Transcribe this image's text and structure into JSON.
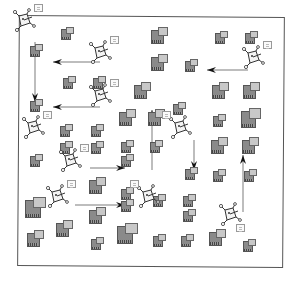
{
  "diagram": {
    "title": "",
    "frame": {
      "x": 18,
      "y": 16,
      "w": 266,
      "h": 251,
      "color": "#555555"
    },
    "colors": {
      "node_back": "#8a8a8a",
      "node_front": "#c8c8c8",
      "line": "#444444",
      "arrow": "#111111"
    },
    "nodes": [
      {
        "x": 68,
        "y": 33,
        "s": 1
      },
      {
        "x": 160,
        "y": 35,
        "s": 1.3
      },
      {
        "x": 222,
        "y": 37,
        "s": 1
      },
      {
        "x": 252,
        "y": 37,
        "s": 1
      },
      {
        "x": 37,
        "y": 50,
        "s": 1
      },
      {
        "x": 160,
        "y": 62,
        "s": 1.3
      },
      {
        "x": 192,
        "y": 65,
        "s": 1
      },
      {
        "x": 70,
        "y": 82,
        "s": 1
      },
      {
        "x": 100,
        "y": 82,
        "s": 1
      },
      {
        "x": 143,
        "y": 90,
        "s": 1.3
      },
      {
        "x": 221,
        "y": 90,
        "s": 1.3
      },
      {
        "x": 252,
        "y": 90,
        "s": 1.3
      },
      {
        "x": 180,
        "y": 108,
        "s": 1
      },
      {
        "x": 37,
        "y": 105,
        "s": 1
      },
      {
        "x": 128,
        "y": 117,
        "s": 1.3
      },
      {
        "x": 157,
        "y": 117,
        "s": 1.3
      },
      {
        "x": 220,
        "y": 120,
        "s": 1
      },
      {
        "x": 251,
        "y": 118,
        "s": 1.5
      },
      {
        "x": 67,
        "y": 130,
        "s": 1
      },
      {
        "x": 98,
        "y": 130,
        "s": 1
      },
      {
        "x": 67,
        "y": 147,
        "s": 1
      },
      {
        "x": 98,
        "y": 147,
        "s": 1
      },
      {
        "x": 128,
        "y": 146,
        "s": 1
      },
      {
        "x": 157,
        "y": 146,
        "s": 1
      },
      {
        "x": 37,
        "y": 160,
        "s": 1
      },
      {
        "x": 128,
        "y": 160,
        "s": 1
      },
      {
        "x": 220,
        "y": 145,
        "s": 1.3
      },
      {
        "x": 251,
        "y": 145,
        "s": 1.3
      },
      {
        "x": 98,
        "y": 185,
        "s": 1.3
      },
      {
        "x": 128,
        "y": 193,
        "s": 1
      },
      {
        "x": 192,
        "y": 173,
        "s": 1
      },
      {
        "x": 220,
        "y": 175,
        "s": 1
      },
      {
        "x": 251,
        "y": 175,
        "s": 1
      },
      {
        "x": 128,
        "y": 205,
        "s": 1
      },
      {
        "x": 36,
        "y": 207,
        "s": 1.6
      },
      {
        "x": 65,
        "y": 228,
        "s": 1.3
      },
      {
        "x": 98,
        "y": 215,
        "s": 1.3
      },
      {
        "x": 160,
        "y": 200,
        "s": 1
      },
      {
        "x": 190,
        "y": 200,
        "s": 1
      },
      {
        "x": 190,
        "y": 215,
        "s": 1
      },
      {
        "x": 36,
        "y": 238,
        "s": 1.3
      },
      {
        "x": 98,
        "y": 243,
        "s": 1
      },
      {
        "x": 128,
        "y": 233,
        "s": 1.6
      },
      {
        "x": 160,
        "y": 240,
        "s": 1
      },
      {
        "x": 188,
        "y": 240,
        "s": 1
      },
      {
        "x": 218,
        "y": 237,
        "s": 1.3
      },
      {
        "x": 250,
        "y": 245,
        "s": 1
      }
    ],
    "agents": [
      {
        "x": 24,
        "y": 20,
        "card": "right"
      },
      {
        "x": 100,
        "y": 52,
        "card": "right"
      },
      {
        "x": 253,
        "y": 57,
        "card": "right"
      },
      {
        "x": 100,
        "y": 95,
        "card": "right"
      },
      {
        "x": 33,
        "y": 127,
        "card": "right"
      },
      {
        "x": 180,
        "y": 127,
        "card": "left"
      },
      {
        "x": 70,
        "y": 160,
        "card": "right"
      },
      {
        "x": 57,
        "y": 196,
        "card": "right"
      },
      {
        "x": 148,
        "y": 196,
        "card": "left"
      },
      {
        "x": 230,
        "y": 214,
        "card": "below"
      }
    ],
    "arrows": [
      {
        "x1": 35,
        "y1": 42,
        "x2": 35,
        "y2": 102,
        "dir": "down"
      },
      {
        "x1": 100,
        "y1": 62,
        "x2": 53,
        "y2": 62,
        "dir": "left"
      },
      {
        "x1": 248,
        "y1": 70,
        "x2": 207,
        "y2": 70,
        "dir": "left"
      },
      {
        "x1": 100,
        "y1": 107,
        "x2": 53,
        "y2": 107,
        "dir": "left"
      },
      {
        "x1": 152,
        "y1": 170,
        "x2": 152,
        "y2": 110,
        "dir": "up"
      },
      {
        "x1": 194,
        "y1": 140,
        "x2": 194,
        "y2": 170,
        "dir": "down"
      },
      {
        "x1": 90,
        "y1": 168,
        "x2": 125,
        "y2": 168,
        "dir": "right"
      },
      {
        "x1": 75,
        "y1": 205,
        "x2": 125,
        "y2": 205,
        "dir": "right"
      },
      {
        "x1": 243,
        "y1": 212,
        "x2": 243,
        "y2": 155,
        "dir": "up"
      }
    ]
  }
}
